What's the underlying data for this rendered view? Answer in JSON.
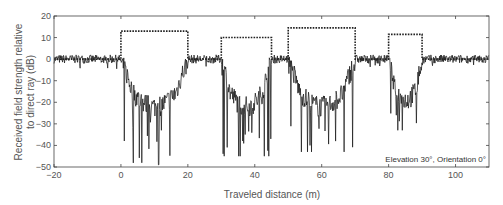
{
  "chart_data": {
    "type": "line",
    "title": "",
    "xlabel": "Traveled distance  (m)",
    "ylabel_line1": "Received field strength relative",
    "ylabel_line2": "to direct ray (dB)",
    "xlim": [
      -20,
      110
    ],
    "ylim": [
      -50,
      20
    ],
    "xticks": [
      -20,
      0,
      20,
      40,
      60,
      80,
      100
    ],
    "yticks": [
      20,
      10,
      0,
      -10,
      -20,
      -30,
      -40,
      -50
    ],
    "grid": false,
    "legend": null,
    "annotation": "Elevation 30°, Orientation 0°",
    "series": [
      {
        "name": "Building height profile (dashed)",
        "style": "dotted",
        "segments": [
          {
            "x_start": 0,
            "x_end": 20,
            "height": 13
          },
          {
            "x_start": 30,
            "x_end": 45,
            "height": 10
          },
          {
            "x_start": 50,
            "x_end": 70,
            "height": 14.5
          },
          {
            "x_start": 80,
            "x_end": 90,
            "height": 11.5
          }
        ],
        "baseline": 0
      },
      {
        "name": "Received field strength (solid)",
        "style": "solid",
        "description": "Fluctuates around 0 dB in open gaps; drops to approx -10 to -30 dB behind each building, with deep fades down to about -45 dB",
        "shadow_regions": [
          {
            "x_start": 0,
            "x_end": 20,
            "mean_db": -20,
            "min_db": -49
          },
          {
            "x_start": 30,
            "x_end": 45,
            "mean_db": -20,
            "min_db": -45
          },
          {
            "x_start": 50,
            "x_end": 70,
            "mean_db": -20,
            "min_db": -43
          },
          {
            "x_start": 80,
            "x_end": 90,
            "mean_db": -17,
            "min_db": -33
          }
        ],
        "open_level_db": 0,
        "open_ripple_db": 2
      }
    ]
  }
}
